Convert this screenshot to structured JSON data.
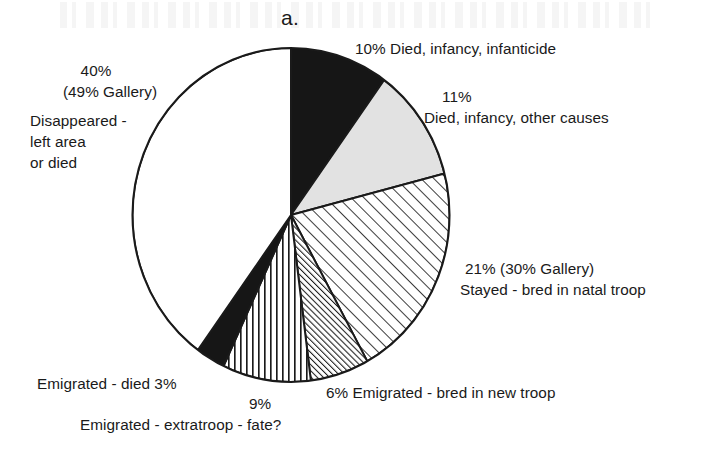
{
  "figure": {
    "panel_letter": "a.",
    "title": "",
    "background_color": "#ffffff",
    "ink_color": "#1a1a1a"
  },
  "chart_data": {
    "type": "pie",
    "title": "a.",
    "start_angle_deg": 0,
    "direction": "clockwise",
    "total_percent": 100,
    "categories": [
      "Died, infancy, infanticide",
      "Died, infancy, other causes",
      "Stayed - bred in natal troop",
      "Emigrated - bred in new troop",
      "Emigrated - extratroop - fate?",
      "Emigrated - died",
      "Disappeared - left area or died"
    ],
    "values": [
      10,
      11,
      21,
      6,
      9,
      3,
      40
    ],
    "slices": [
      {
        "label": "Died, infancy, infanticide",
        "percent": 10,
        "percent_text": "10%",
        "alt_percent_text": "",
        "fill": "solid-black",
        "fill_color": "#161616",
        "start_deg": 0,
        "end_deg": 36
      },
      {
        "label": "Died, infancy, other causes",
        "percent": 11,
        "percent_text": "11%",
        "alt_percent_text": "",
        "fill": "light-gray",
        "fill_color": "#e2e2e2",
        "start_deg": 36,
        "end_deg": 75.6
      },
      {
        "label": "Stayed - bred in natal troop",
        "percent": 21,
        "percent_text": "21%",
        "alt_percent_text": "(30% Gallery)",
        "fill": "diagonal-hatch-wide",
        "fill_color": "#ffffff",
        "start_deg": 75.6,
        "end_deg": 151.2
      },
      {
        "label": "Emigrated - bred in new troop",
        "percent": 6,
        "percent_text": "6%",
        "alt_percent_text": "",
        "fill": "diagonal-hatch-dense",
        "fill_color": "#ffffff",
        "start_deg": 151.2,
        "end_deg": 172.8
      },
      {
        "label": "Emigrated - extratroop - fate?",
        "percent": 9,
        "percent_text": "9%",
        "alt_percent_text": "",
        "fill": "vertical-stripes",
        "fill_color": "#ffffff",
        "start_deg": 172.8,
        "end_deg": 205.2
      },
      {
        "label": "Emigrated - died",
        "percent": 3,
        "percent_text": "3%",
        "alt_percent_text": "",
        "fill": "solid-black",
        "fill_color": "#161616",
        "start_deg": 205.2,
        "end_deg": 216
      },
      {
        "label": "Disappeared - left area or died",
        "percent": 40,
        "percent_text": "40%",
        "alt_percent_text": "(49% Gallery)",
        "fill": "white",
        "fill_color": "#ffffff",
        "start_deg": 216,
        "end_deg": 360
      }
    ],
    "legend_position": "callout-labels",
    "grid": false
  },
  "labels": {
    "infanticide": "10% Died, infancy, infanticide",
    "other_causes_pct": "11%",
    "other_causes_text": "Died, infancy, other causes",
    "natal_troop_pct": "21% (30% Gallery)",
    "natal_troop_text": "Stayed - bred in natal troop",
    "disappeared_pct": "40%",
    "disappeared_gallery": "(49% Gallery)",
    "disappeared_l1": "Disappeared -",
    "disappeared_l2": "left area",
    "disappeared_l3": "or died",
    "emigrated_died": "Emigrated - died  3%",
    "extratroop_pct": "9%",
    "extratroop_text": "Emigrated - extratroop - fate?",
    "new_troop": "6% Emigrated - bred in new troop"
  }
}
